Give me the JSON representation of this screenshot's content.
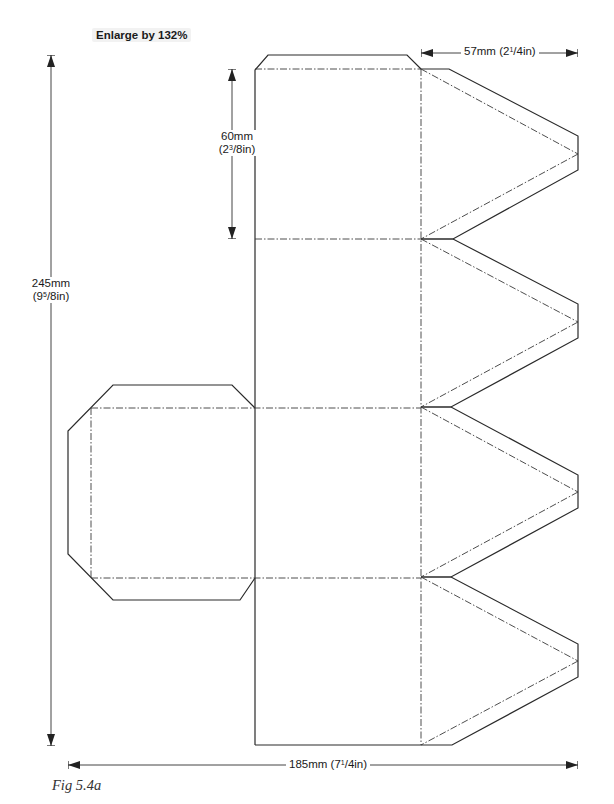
{
  "header": {
    "enlarge_label": "Enlarge by 132%"
  },
  "dimensions": {
    "top_width": {
      "mm": "57mm",
      "in_pre": "(2",
      "in_frac": "1",
      "in_post": "/4in)"
    },
    "panel_height": {
      "mm": "60mm",
      "in_pre": "(2",
      "in_frac": "3",
      "in_post": "/8in)"
    },
    "total_height": {
      "mm": "245mm",
      "in_pre": "(9",
      "in_frac": "5",
      "in_post": "/8in)"
    },
    "total_width": {
      "mm": "185mm",
      "in_pre": "(7",
      "in_frac": "1",
      "in_post": "/4in)"
    }
  },
  "caption": "Fig 5.4a",
  "colors": {
    "cut_line": "#2a2a2a",
    "fold_line": "#3a3a3a",
    "dimension_line": "#444444",
    "background": "#ffffff"
  },
  "geometry": {
    "cut_polylines": [
      [
        [
          255,
          745
        ],
        [
          255,
          70
        ],
        [
          268,
          55
        ],
        [
          407,
          55
        ],
        [
          421,
          69
        ]
      ],
      [
        [
          421,
          69
        ],
        [
          449,
          69
        ],
        [
          578,
          136
        ],
        [
          578,
          170
        ],
        [
          453,
          239
        ],
        [
          421,
          239
        ]
      ],
      [
        [
          421,
          239
        ],
        [
          453,
          239
        ],
        [
          578,
          304
        ],
        [
          578,
          338
        ],
        [
          451,
          407
        ],
        [
          421,
          407
        ]
      ],
      [
        [
          421,
          407
        ],
        [
          451,
          407
        ],
        [
          578,
          475
        ],
        [
          578,
          508
        ],
        [
          451,
          577
        ],
        [
          421,
          577
        ]
      ],
      [
        [
          421,
          577
        ],
        [
          451,
          577
        ],
        [
          578,
          644
        ],
        [
          578,
          677
        ],
        [
          452,
          745
        ],
        [
          255,
          745
        ]
      ],
      [
        [
          255,
          408
        ],
        [
          232,
          385
        ],
        [
          113,
          385
        ],
        [
          68,
          431
        ],
        [
          68,
          554
        ],
        [
          113,
          600
        ],
        [
          240,
          600
        ],
        [
          255,
          578
        ]
      ]
    ],
    "fold_lines": [
      [
        [
          255,
          69
        ],
        [
          421,
          69
        ]
      ],
      [
        [
          255,
          239
        ],
        [
          421,
          239
        ]
      ],
      [
        [
          91,
          408
        ],
        [
          421,
          408
        ]
      ],
      [
        [
          91,
          578
        ],
        [
          421,
          578
        ]
      ],
      [
        [
          421,
          69
        ],
        [
          421,
          745
        ]
      ],
      [
        [
          91,
          408
        ],
        [
          91,
          578
        ]
      ],
      [
        [
          421,
          69
        ],
        [
          578,
          154
        ]
      ],
      [
        [
          578,
          154
        ],
        [
          421,
          239
        ]
      ],
      [
        [
          421,
          239
        ],
        [
          578,
          322
        ]
      ],
      [
        [
          578,
          322
        ],
        [
          421,
          407
        ]
      ],
      [
        [
          421,
          407
        ],
        [
          578,
          492
        ]
      ],
      [
        [
          578,
          492
        ],
        [
          421,
          577
        ]
      ],
      [
        [
          421,
          577
        ],
        [
          578,
          661
        ]
      ],
      [
        [
          578,
          661
        ],
        [
          421,
          745
        ]
      ]
    ],
    "dimension_lines": [
      {
        "name": "top-width",
        "x1": 421,
        "y1": 53,
        "x2": 578,
        "y2": 53,
        "orient": "h"
      },
      {
        "name": "panel-height",
        "x1": 232,
        "y1": 69,
        "x2": 232,
        "y2": 239,
        "orient": "v"
      },
      {
        "name": "total-height",
        "x1": 51,
        "y1": 55,
        "x2": 51,
        "y2": 746,
        "orient": "v"
      },
      {
        "name": "total-width",
        "x1": 68,
        "y1": 765,
        "x2": 578,
        "y2": 765,
        "orient": "h"
      }
    ]
  }
}
